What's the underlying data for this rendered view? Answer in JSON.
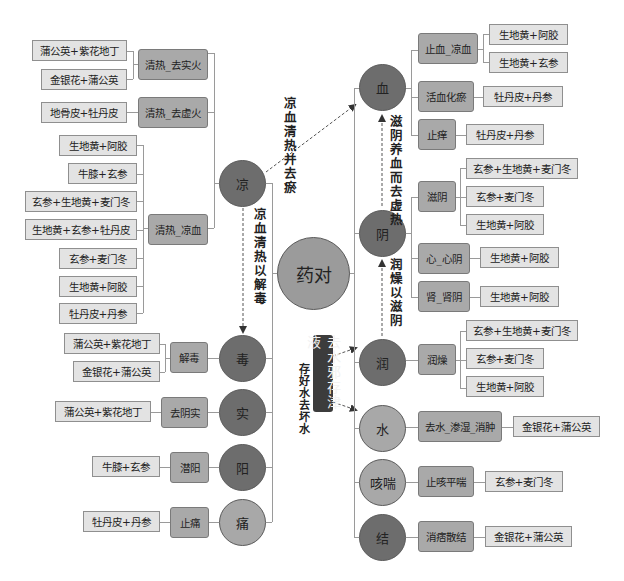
{
  "center": {
    "label": "药对"
  },
  "left": [
    {
      "id": "liang",
      "label": "凉",
      "tone": "dark",
      "groups": [
        {
          "label": "清热_去实火",
          "items": [
            "蒲公英+紫花地丁",
            "金银花+蒲公英"
          ]
        },
        {
          "label": "清热_去虚火",
          "items": [
            "地骨皮+牡丹皮"
          ]
        },
        {
          "label": "清热_凉血",
          "items": [
            "生地黄+阿胶",
            "牛膝+玄参",
            "玄参+生地黄+麦门冬",
            "生地黄+玄参+牡丹皮",
            "玄参+麦门冬",
            "生地黄+阿胶",
            "牡丹皮+丹参"
          ]
        }
      ]
    },
    {
      "id": "du",
      "label": "毒",
      "tone": "dark",
      "groups": [
        {
          "label": "解毒",
          "items": [
            "蒲公英+紫花地丁",
            "金银花+蒲公英"
          ]
        }
      ]
    },
    {
      "id": "shi",
      "label": "实",
      "tone": "dark",
      "groups": [
        {
          "label": "去阴实",
          "items": [
            "蒲公英+紫花地丁"
          ]
        }
      ]
    },
    {
      "id": "yang",
      "label": "阳",
      "tone": "dark",
      "groups": [
        {
          "label": "潜阳",
          "items": [
            "牛膝+玄参"
          ]
        }
      ]
    },
    {
      "id": "tong",
      "label": "痛",
      "tone": "light",
      "groups": [
        {
          "label": "止痛",
          "items": [
            "牡丹皮+丹参"
          ]
        }
      ]
    }
  ],
  "right": [
    {
      "id": "xue",
      "label": "血",
      "tone": "dark",
      "groups": [
        {
          "label": "止血_凉血",
          "items": [
            "生地黄+阿胶",
            "生地黄+玄参"
          ]
        },
        {
          "label": "活血化瘀",
          "items": [
            "牡丹皮+丹参"
          ]
        },
        {
          "label": "止痒",
          "items": [
            "牡丹皮+丹参"
          ]
        }
      ]
    },
    {
      "id": "yin",
      "label": "阴",
      "tone": "dark",
      "groups": [
        {
          "label": "滋阴",
          "items": [
            "玄参+生地黄+麦门冬",
            "玄参+麦门冬",
            "生地黄+阿胶"
          ]
        },
        {
          "label": "心_心阴",
          "items": [
            "生地黄+阿胶"
          ]
        },
        {
          "label": "肾_肾阴",
          "items": [
            "生地黄+阿胶"
          ]
        }
      ]
    },
    {
      "id": "run",
      "label": "润",
      "tone": "dark",
      "groups": [
        {
          "label": "润燥",
          "items": [
            "玄参+生地黄+麦门冬",
            "玄参+麦门冬",
            "生地黄+阿胶"
          ]
        }
      ]
    },
    {
      "id": "shui",
      "label": "水",
      "tone": "light",
      "groups": [
        {
          "label": "去水_渗湿_消肿",
          "items": [
            "金银花+蒲公英"
          ]
        }
      ]
    },
    {
      "id": "kechuan",
      "label": "咳喘",
      "tone": "light",
      "groups": [
        {
          "label": "止咳平喘",
          "items": [
            "玄参+麦门冬"
          ]
        }
      ]
    },
    {
      "id": "jie",
      "label": "结",
      "tone": "dark",
      "groups": [
        {
          "label": "消痞散结",
          "items": [
            "金银花+蒲公英"
          ]
        }
      ]
    }
  ],
  "annotations": {
    "liang_to_xue": "凉血清热并去瘀",
    "liang_to_du": "凉血清热以解毒",
    "yin_to_xue": "滋阴养血而去虚热",
    "run_to_yin": "润燥以滋阴",
    "banner": "去水邪存津液",
    "banner_side": "存好水去坏水"
  },
  "colors": {
    "circle_dark": "#6d6d6d",
    "circle_light": "#a8a8a8",
    "center": "#9b9b9b",
    "mid_box": "#a9a9a9",
    "leaf_box": "#e3e3e3",
    "banner": "#3c3c3c",
    "connector": "#9a9a9a"
  }
}
